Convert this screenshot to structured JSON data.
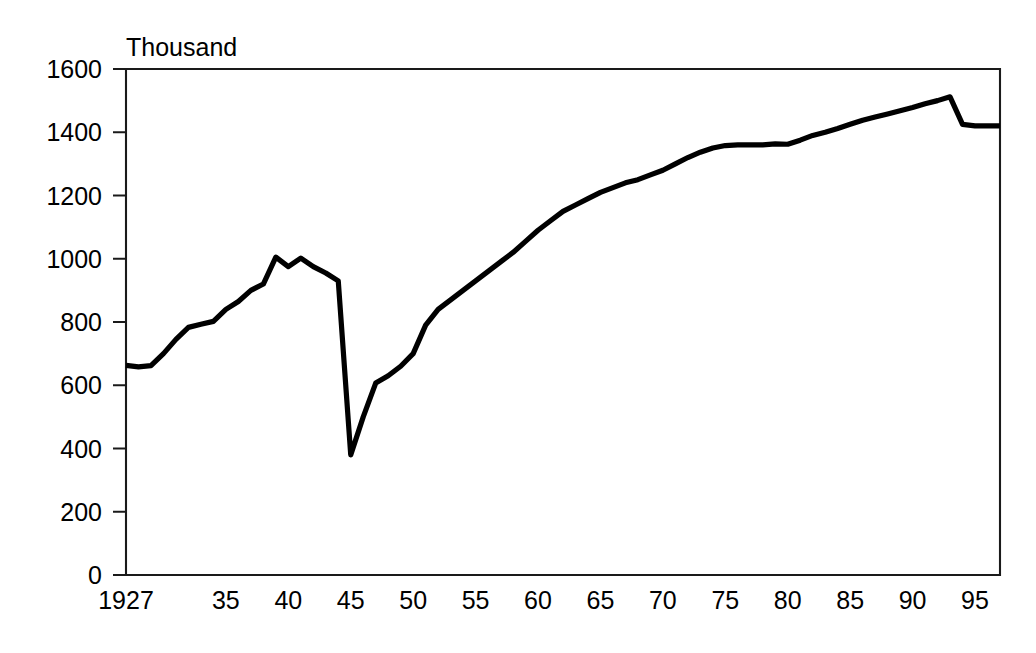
{
  "chart_data": {
    "type": "line",
    "title": "",
    "subtitle": "",
    "xlabel": "",
    "ylabel": "Thousand",
    "ylim": [
      0,
      1600
    ],
    "xlim": [
      1927,
      1997
    ],
    "yticks": [
      0,
      200,
      400,
      600,
      800,
      1000,
      1200,
      1400,
      1600
    ],
    "ytick_labels": [
      "0",
      "200",
      "400",
      "600",
      "800",
      "1000",
      "1200",
      "1400",
      "1600"
    ],
    "xticks": [
      1927,
      1935,
      1940,
      1945,
      1950,
      1955,
      1960,
      1965,
      1970,
      1975,
      1980,
      1985,
      1990,
      1995
    ],
    "xtick_labels": [
      "1927",
      "35",
      "40",
      "45",
      "50",
      "55",
      "60",
      "65",
      "70",
      "75",
      "80",
      "85",
      "90",
      "95"
    ],
    "grid": false,
    "legend": false,
    "legend_position": "none",
    "line_color": "#000000",
    "series": [
      {
        "name": "Thousand",
        "x": [
          1927,
          1928,
          1929,
          1930,
          1931,
          1932,
          1933,
          1934,
          1935,
          1936,
          1937,
          1938,
          1939,
          1940,
          1941,
          1942,
          1943,
          1944,
          1945,
          1946,
          1947,
          1948,
          1949,
          1950,
          1951,
          1952,
          1953,
          1954,
          1955,
          1956,
          1957,
          1958,
          1959,
          1960,
          1961,
          1962,
          1963,
          1964,
          1965,
          1966,
          1967,
          1968,
          1969,
          1970,
          1971,
          1972,
          1973,
          1974,
          1975,
          1976,
          1977,
          1978,
          1979,
          1980,
          1981,
          1982,
          1983,
          1984,
          1985,
          1986,
          1987,
          1988,
          1989,
          1990,
          1991,
          1992,
          1993,
          1994,
          1995,
          1996,
          1997
        ],
        "values": [
          663,
          658,
          662,
          700,
          745,
          783,
          793,
          802,
          840,
          865,
          900,
          920,
          1005,
          975,
          1002,
          975,
          955,
          930,
          380,
          500,
          607,
          630,
          660,
          700,
          790,
          840,
          870,
          900,
          930,
          960,
          990,
          1020,
          1055,
          1090,
          1120,
          1150,
          1170,
          1190,
          1210,
          1225,
          1240,
          1250,
          1265,
          1280,
          1300,
          1320,
          1337,
          1350,
          1358,
          1360,
          1360,
          1360,
          1363,
          1362,
          1375,
          1390,
          1400,
          1412,
          1425,
          1438,
          1448,
          1458,
          1468,
          1478,
          1490,
          1500,
          1512,
          1425,
          1420,
          1420,
          1420
        ]
      }
    ]
  },
  "plot_geometry": {
    "left": 126,
    "right": 1000,
    "top": 69,
    "bottom": 575
  }
}
